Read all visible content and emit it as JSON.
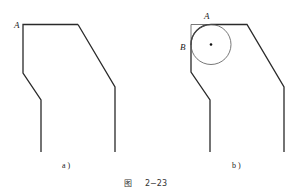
{
  "figure": {
    "caption_prefix": "图",
    "caption_number": "2−23"
  },
  "panels": [
    {
      "id": "a",
      "label": "a )",
      "points": [
        {
          "name": "A",
          "label": "A"
        }
      ]
    },
    {
      "id": "b",
      "label": "b )",
      "points": [
        {
          "name": "A",
          "label": "A"
        },
        {
          "name": "B",
          "label": "B"
        }
      ],
      "has_inscribed_circle": true,
      "circle_center_marked": true
    }
  ]
}
